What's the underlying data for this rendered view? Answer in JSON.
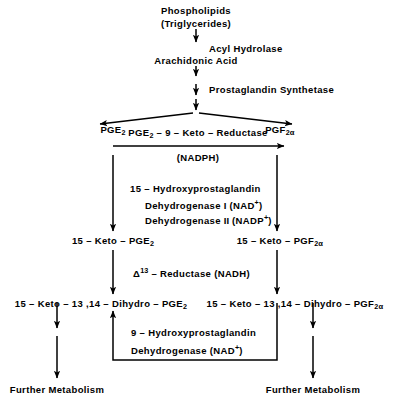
{
  "diagram": {
    "nodes": {
      "phospholipids": "Phospholipids",
      "triglycerides": "(Triglycerides)",
      "arachidonic_acid": "Arachidonic  Acid",
      "pge2": "PGE",
      "pge2_sub": "2",
      "pgf2a": "PGF",
      "pgf2a_sub": "2",
      "pgf2a_greek": "α",
      "keto_pge2_prefix": "15 – Keto – PGE",
      "keto_pge2_sub": "2",
      "keto_pgf2a_prefix": "15 – Keto – PGF",
      "keto_pgf2a_sub": "2",
      "keto_pgf2a_greek": "α",
      "dihydro_pge2_prefix": "15 – Keto – 13 ,14 – Dihydro – PGE",
      "dihydro_pge2_sub": "2",
      "dihydro_pgf2a_prefix": "15 – Keto – 13 ,14 – Dihydro – PGF",
      "dihydro_pgf2a_sub": "2",
      "dihydro_pgf2a_greek": "α",
      "further_metabolism_left": "Further  Metabolism",
      "further_metabolism_right": "Further  Metabolism"
    },
    "enzymes": {
      "acyl_hydrolase": "Acyl  Hydrolase",
      "prostaglandin_synthetase": "Prostaglandin   Synthetase",
      "keto_reductase_prefix": "PGE",
      "keto_reductase_sub": "2",
      "keto_reductase_suffix": " – 9 – Keto – Reductase",
      "nadph": "(NADPH)",
      "hydroxyprostaglandin_15": "15 – Hydroxyprostaglandin",
      "dehydrogenase_1_prefix": "Dehydrogenase ",
      "dehydrogenase_1_roman": "I",
      "dehydrogenase_1_cofactor": " (NAD",
      "dehydrogenase_1_charge": "+",
      "dehydrogenase_1_close": ")",
      "dehydrogenase_2_prefix": "Dehydrogenase ",
      "dehydrogenase_2_roman": "II",
      "dehydrogenase_2_cofactor": " (NADP",
      "dehydrogenase_2_charge": "+",
      "dehydrogenase_2_close": ")",
      "delta13_greek": "Δ",
      "delta13_sup": "13",
      "delta13_suffix": " – Reductase  (NADH)",
      "hydroxyprostaglandin_9": "9 – Hydroxyprostaglandin",
      "dehydrogenase_9_prefix": "Dehydrogenase  (NAD",
      "dehydrogenase_9_charge": "+",
      "dehydrogenase_9_close": ")"
    },
    "colors": {
      "ink": "#000000",
      "background": "#ffffff"
    }
  }
}
